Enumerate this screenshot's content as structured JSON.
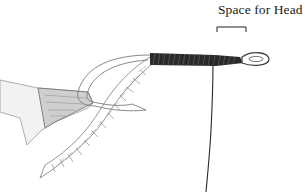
{
  "figure": {
    "annotation": {
      "label": "Space for Head",
      "bracket": "bracket-marking-head-space"
    },
    "colors": {
      "background": "#ffffff",
      "pencil": "#555555",
      "thread": "#1e1e1e",
      "label": "#1a1a1a"
    }
  }
}
